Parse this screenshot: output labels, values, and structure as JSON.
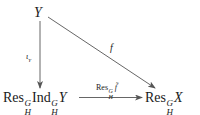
{
  "diagram": {
    "nodes": {
      "top": {
        "text": "Y"
      },
      "bottom_left": {
        "res": "Res",
        "res_sup": "G",
        "res_sub": "H",
        "ind": "Ind",
        "ind_sup": "G",
        "ind_sub": "H",
        "obj": "Y"
      },
      "bottom_right": {
        "res": "Res",
        "res_sup": "G",
        "res_sub": "H",
        "obj": "X"
      }
    },
    "arrows": {
      "vertical": {
        "label": "ι",
        "label_sub": "Y",
        "from": "Y",
        "to": "Res^G_H Ind^G_H Y"
      },
      "diagonal": {
        "label": "f",
        "from": "Y",
        "to": "Res^G_H X"
      },
      "horizontal": {
        "label_res": "Res",
        "label_sup": "G",
        "label_sub": "H",
        "label_map": "f̃",
        "from": "Res^G_H Ind^G_H Y",
        "to": "Res^G_H X"
      }
    },
    "colors": {
      "ink": "#1a1a1a",
      "line": "#555555"
    }
  }
}
